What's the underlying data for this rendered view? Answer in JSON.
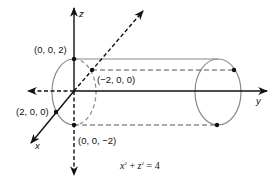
{
  "diagram": {
    "title_equation": {
      "var1": "x",
      "exp1": "2",
      "plus": "+",
      "var2": "z",
      "exp2": "2",
      "equals": "=",
      "rhs": "4"
    },
    "axes": {
      "x_label": "x",
      "y_label": "y",
      "z_label": "z"
    },
    "points": {
      "p_top": "(0, 0, 2)",
      "p_back": "(−2, 0, 0)",
      "p_front": "(2, 0, 0)",
      "p_bottom": "(0, 0, −2)"
    },
    "colors": {
      "axis": "#111111",
      "surface": "#8a8a8a",
      "hidden": "#555555",
      "background": "#ffffff"
    }
  }
}
